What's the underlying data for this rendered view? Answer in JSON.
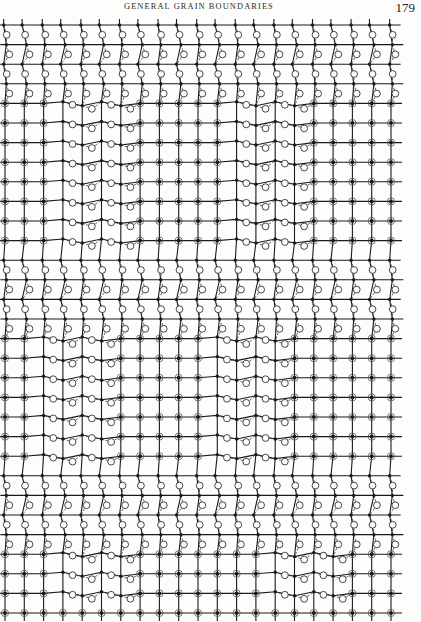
{
  "header": {
    "running_title": "GENERAL GRAIN BOUNDARIES",
    "page_number": "179"
  },
  "figure": {
    "ink_color": "#1a1a1a",
    "dash_color": "#3a3a3a",
    "grid": {
      "origin_x": 5,
      "origin_y": 7,
      "col_spacing": 19.3,
      "row_spacing": 19.6,
      "columns": 21,
      "rows": 31
    },
    "legend": {
      "filled_dot": "atom of grain A (small solid dot)",
      "circled_dot": "coincident atom site (dot within circle)",
      "open_circle": "atom of grain B (open circle)",
      "dashed_line": "bond of grain B lattice"
    },
    "boundary_bands": [
      {
        "name": "top-horizontal-band",
        "row_start": 0,
        "row_end": 4,
        "col_start": 0,
        "col_end": 20,
        "tilt": "vertical"
      },
      {
        "name": "upper-left-diagonal-band",
        "row_start": 4,
        "row_end": 12,
        "col_start": 3,
        "col_end": 6,
        "tilt": "horizontal"
      },
      {
        "name": "upper-right-diagonal-band",
        "row_start": 4,
        "row_end": 12,
        "col_start": 12,
        "col_end": 15,
        "tilt": "horizontal"
      },
      {
        "name": "middle-horizontal-band",
        "row_start": 12,
        "row_end": 16,
        "col_start": 0,
        "col_end": 20,
        "tilt": "vertical"
      },
      {
        "name": "lower-left-diagonal-band",
        "row_start": 16,
        "row_end": 23,
        "col_start": 2,
        "col_end": 5,
        "tilt": "horizontal"
      },
      {
        "name": "lower-right-diagonal-band",
        "row_start": 16,
        "row_end": 23,
        "col_start": 11,
        "col_end": 14,
        "tilt": "horizontal"
      },
      {
        "name": "lower-horizontal-band",
        "row_start": 23,
        "row_end": 27,
        "col_start": 0,
        "col_end": 20,
        "tilt": "vertical"
      },
      {
        "name": "bottom-left-diagonal-band",
        "row_start": 27,
        "row_end": 30,
        "col_start": 3,
        "col_end": 6,
        "tilt": "horizontal"
      },
      {
        "name": "bottom-right-diagonal-band",
        "row_start": 27,
        "row_end": 30,
        "col_start": 14,
        "col_end": 17,
        "tilt": "horizontal"
      }
    ]
  }
}
